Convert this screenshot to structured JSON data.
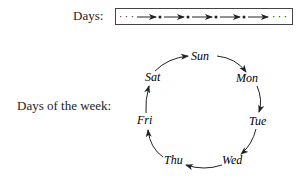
{
  "linear": {
    "label": "Days:",
    "start_ellipsis": "· · ·",
    "end_ellipsis": "· · ·",
    "arrow_count": 5,
    "node_count": 4
  },
  "cycle": {
    "label": "Days of the week:",
    "days": [
      "Sun",
      "Mon",
      "Tue",
      "Wed",
      "Thu",
      "Fri",
      "Sat"
    ]
  }
}
